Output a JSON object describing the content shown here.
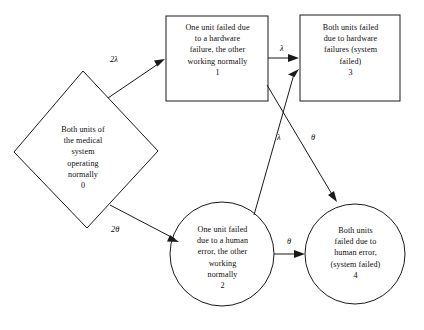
{
  "diagram": {
    "type": "state-transition-diagram",
    "background_color": "#ffffff",
    "line_color": "#1a1a1a",
    "text_color": "#0d0d0d",
    "states": [
      {
        "id": "0",
        "number": "0",
        "shape": "diamond",
        "text": "Both units of\nthe medical\nsystem\noperating\nnormally\n0",
        "description": "Both units of the medical system operating normally"
      },
      {
        "id": "1",
        "number": "1",
        "shape": "rectangle",
        "text": "One unit failed due\nto a hardware\nfailure, the other\nworking normally\n1",
        "description": "One unit failed due to a hardware failure, the other working normally"
      },
      {
        "id": "3",
        "number": "3",
        "shape": "rectangle",
        "text": "Both units failed\ndue to hardware\nfailures (system\nfailed)\n3",
        "description": "Both units failed due to hardware failures (system failed)"
      },
      {
        "id": "2",
        "number": "2",
        "shape": "circle",
        "text": "One unit failed\ndue to a human\nerror, the other\nworking\nnormally\n2",
        "description": "One unit failed due to a human error, the other working normally"
      },
      {
        "id": "4",
        "number": "4",
        "shape": "circle",
        "text": "Both units\nfailed due to\nhuman error,\n(system failed)\n4",
        "description": "Both units failed due to human error, (system failed)"
      }
    ],
    "transitions": [
      {
        "from": "0",
        "to": "1",
        "label": "2λ"
      },
      {
        "from": "0",
        "to": "2",
        "label": "2θ"
      },
      {
        "from": "1",
        "to": "3",
        "label": "λ"
      },
      {
        "from": "2",
        "to": "3",
        "label": "λ"
      },
      {
        "from": "1",
        "to": "4",
        "label": "θ"
      },
      {
        "from": "2",
        "to": "4",
        "label": "θ"
      }
    ]
  }
}
